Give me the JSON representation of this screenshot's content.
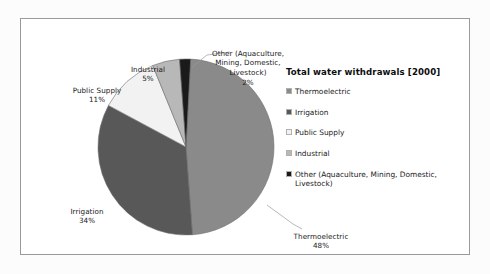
{
  "chart_data": {
    "type": "pie",
    "title": "Total water withdrawals [2000]",
    "legend_position": "right",
    "categories": [
      "Thermoelectric",
      "Irrigation",
      "Public Supply",
      "Industrial",
      "Other (Aquaculture, Mining, Domestic, Livestock)"
    ],
    "values": [
      48,
      34,
      11,
      5,
      2
    ],
    "value_unit": "%",
    "slices": [
      {
        "name": "Thermoelectric",
        "value": 48,
        "label": "Thermoelectric",
        "pct_text": "48%",
        "color": "#8a8a8a"
      },
      {
        "name": "Irrigation",
        "value": 34,
        "label": "Irrigation",
        "pct_text": "34%",
        "color": "#585858"
      },
      {
        "name": "Public Supply",
        "value": 11,
        "label": "Public Supply",
        "pct_text": "11%",
        "color": "#f2f2f2"
      },
      {
        "name": "Industrial",
        "value": 5,
        "label": "Industrial",
        "pct_text": "5%",
        "color": "#b8b8b8"
      },
      {
        "name": "Other",
        "value": 2,
        "label": "Other (Aquaculture,\nMining, Domestic,\nLivestock)",
        "pct_text": "2%",
        "color": "#1a1a1a"
      }
    ]
  },
  "legend": {
    "title": "Total water withdrawals [2000]",
    "items": [
      {
        "label": "Thermoelectric",
        "color": "#8a8a8a"
      },
      {
        "label": "Irrigation",
        "color": "#585858"
      },
      {
        "label": "Public Supply",
        "color": "#f2f2f2"
      },
      {
        "label": "Industrial",
        "color": "#b8b8b8"
      },
      {
        "label": "Other (Aquaculture, Mining, Domestic,\nLivestock)",
        "color": "#1a1a1a"
      }
    ]
  },
  "colors": {
    "frame_border": "#9a9a9a",
    "canvas": "#ffffff",
    "page": "#fcfcfc",
    "text": "#1a1a1a",
    "leader_line": "#9a9a9a"
  }
}
